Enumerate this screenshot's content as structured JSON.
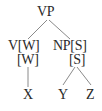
{
  "tree": {
    "root": {
      "label": "VP"
    },
    "left": {
      "label": "V[W]",
      "sub": "[W]",
      "leaf": "X"
    },
    "right": {
      "label": "NP[S]",
      "sub": "[S]",
      "leaves": [
        "Y",
        "Z"
      ]
    }
  },
  "colors": {
    "text": "#2a2a2a",
    "edge": "#8a8a8a",
    "background": "#ffffff"
  }
}
